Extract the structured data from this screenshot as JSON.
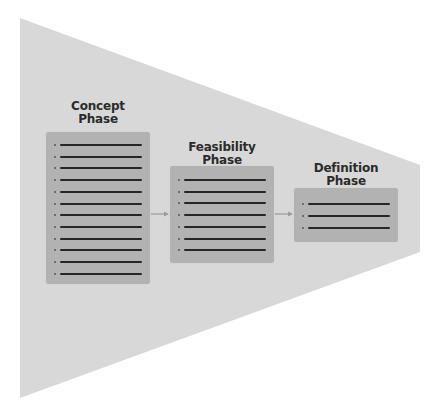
{
  "diagram": {
    "type": "funnel-process",
    "colors": {
      "background": "#ffffff",
      "funnel": "#d8d8d8",
      "box": "#b2b2b2",
      "line": "#262626",
      "arrow": "#9a9a9a",
      "title_text": "#2b2b2b"
    },
    "funnel": {
      "points": [
        [
          20,
          18
        ],
        [
          420,
          165
        ],
        [
          420,
          252
        ],
        [
          20,
          398
        ]
      ]
    },
    "phases": [
      {
        "title_line1": "Concept",
        "title_line2": "Phase",
        "item_count": 12
      },
      {
        "title_line1": "Feasibility",
        "title_line2": "Phase",
        "item_count": 7
      },
      {
        "title_line1": "Definition",
        "title_line2": "Phase",
        "item_count": 3
      }
    ],
    "arrows": [
      {
        "from": "Concept Phase",
        "to": "Feasibility Phase"
      },
      {
        "from": "Feasibility Phase",
        "to": "Definition Phase"
      }
    ]
  }
}
